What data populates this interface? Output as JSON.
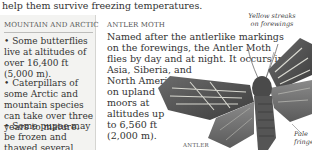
{
  "intro": {
    "text": "help them survive freezing temperatures."
  },
  "sidebar": {
    "title": "Mountain and arctic",
    "bullets": [
      "• Some butterflies live at altitudes of over 16,400 ft (5,000 m).",
      "• Caterpillars of some Arctic and mountain species can take over three years to mature.",
      "• Some pupae may be frozen and thawed several times."
    ]
  },
  "moth": {
    "title": "Antler moth",
    "lines": [
      "Named after the antlerlike markings",
      "on the forewings, the Antler Moth",
      "flies by day and at night. It occurs in",
      "Asia, Siberia, and",
      "North America",
      "on upland",
      "moors at",
      "altitudes up",
      "to 6,560 ft",
      "(2,000 m)."
    ],
    "image_label": "Antler",
    "callouts": {
      "yellow": "Yellow streaks on forewings",
      "pale": "Pale fringes"
    }
  },
  "colors": {
    "sidebar_bg": "#f3f3f1",
    "text": "#333333",
    "rule": "#bdbdbb"
  }
}
